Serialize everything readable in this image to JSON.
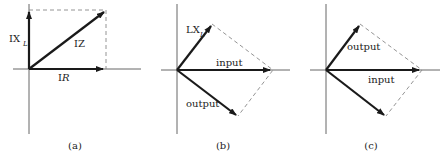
{
  "panels": [
    {
      "id": "a",
      "caption": "(a)",
      "labels": {
        "vertical_vector_main": "IX",
        "vertical_vector_sub": "L",
        "diagonal_vector": "IZ",
        "horizontal_vector_prefix": "I",
        "horizontal_vector_var": "R"
      }
    },
    {
      "id": "b",
      "caption": "(b)",
      "labels": {
        "upper_vector_main": "LX",
        "upper_vector_sub": "L",
        "horizontal_vector": "input",
        "lower_vector": "output"
      }
    },
    {
      "id": "c",
      "caption": "(c)",
      "labels": {
        "upper_vector": "output",
        "horizontal_vector": "input"
      }
    }
  ],
  "colors": {
    "vector": "#1a1a1a",
    "axis": "#555555",
    "dashed": "#888888"
  }
}
